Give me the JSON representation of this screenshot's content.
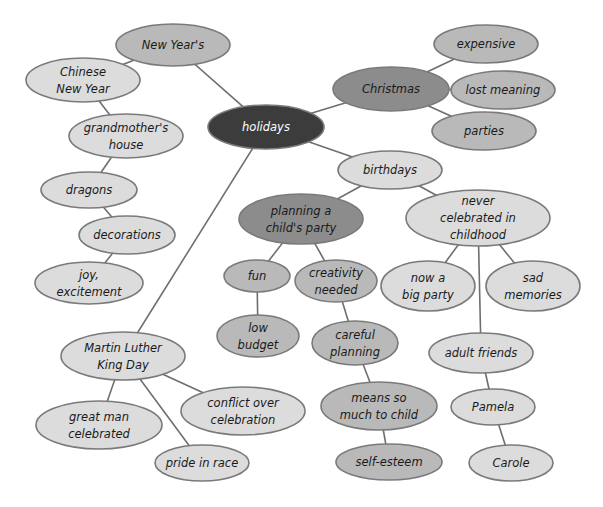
{
  "colors": {
    "root": "#3c3c3c",
    "dark": "#8c8c8c",
    "medium": "#b9b9b9",
    "light": "#dcdcdc",
    "edge": "#6e6e6e"
  },
  "nodes": [
    {
      "id": "holidays",
      "lines": [
        "holidays"
      ],
      "shade": "root"
    },
    {
      "id": "new-years",
      "lines": [
        "New Year's"
      ],
      "shade": "medium"
    },
    {
      "id": "chinese-new-year",
      "lines": [
        "Chinese",
        "New Year"
      ],
      "shade": "light"
    },
    {
      "id": "grandmothers-house",
      "lines": [
        "grandmother's",
        "house"
      ],
      "shade": "light"
    },
    {
      "id": "dragons",
      "lines": [
        "dragons"
      ],
      "shade": "light"
    },
    {
      "id": "decorations",
      "lines": [
        "decorations"
      ],
      "shade": "light"
    },
    {
      "id": "joy-excitement",
      "lines": [
        "joy,",
        "excitement"
      ],
      "shade": "light"
    },
    {
      "id": "christmas",
      "lines": [
        "Christmas"
      ],
      "shade": "dark"
    },
    {
      "id": "expensive",
      "lines": [
        "expensive"
      ],
      "shade": "medium"
    },
    {
      "id": "lost-meaning",
      "lines": [
        "lost meaning"
      ],
      "shade": "medium"
    },
    {
      "id": "parties",
      "lines": [
        "parties"
      ],
      "shade": "medium"
    },
    {
      "id": "birthdays",
      "lines": [
        "birthdays"
      ],
      "shade": "light"
    },
    {
      "id": "planning-childs-party",
      "lines": [
        "planning a",
        "child's party"
      ],
      "shade": "dark"
    },
    {
      "id": "never-celebrated",
      "lines": [
        "never",
        "celebrated in",
        "childhood"
      ],
      "shade": "light"
    },
    {
      "id": "fun",
      "lines": [
        "fun"
      ],
      "shade": "medium"
    },
    {
      "id": "creativity-needed",
      "lines": [
        "creativity",
        "needed"
      ],
      "shade": "medium"
    },
    {
      "id": "low-budget",
      "lines": [
        "low",
        "budget"
      ],
      "shade": "medium"
    },
    {
      "id": "careful-planning",
      "lines": [
        "careful",
        "planning"
      ],
      "shade": "medium"
    },
    {
      "id": "means-so-much",
      "lines": [
        "means so",
        "much to child"
      ],
      "shade": "medium"
    },
    {
      "id": "self-esteem",
      "lines": [
        "self-esteem"
      ],
      "shade": "medium"
    },
    {
      "id": "now-big-party",
      "lines": [
        "now a",
        "big party"
      ],
      "shade": "light"
    },
    {
      "id": "sad-memories",
      "lines": [
        "sad",
        "memories"
      ],
      "shade": "light"
    },
    {
      "id": "adult-friends",
      "lines": [
        "adult friends"
      ],
      "shade": "light"
    },
    {
      "id": "pamela",
      "lines": [
        "Pamela"
      ],
      "shade": "light"
    },
    {
      "id": "carole",
      "lines": [
        "Carole"
      ],
      "shade": "light"
    },
    {
      "id": "mlk-day",
      "lines": [
        "Martin Luther",
        "King Day"
      ],
      "shade": "light"
    },
    {
      "id": "great-man",
      "lines": [
        "great man",
        "celebrated"
      ],
      "shade": "light"
    },
    {
      "id": "pride-in-race",
      "lines": [
        "pride in race"
      ],
      "shade": "light"
    },
    {
      "id": "conflict-over-celebration",
      "lines": [
        "conflict over",
        "celebration"
      ],
      "shade": "light"
    }
  ],
  "edges": [
    [
      "holidays",
      "new-years"
    ],
    [
      "new-years",
      "chinese-new-year"
    ],
    [
      "chinese-new-year",
      "grandmothers-house"
    ],
    [
      "grandmothers-house",
      "dragons"
    ],
    [
      "dragons",
      "decorations"
    ],
    [
      "decorations",
      "joy-excitement"
    ],
    [
      "holidays",
      "christmas"
    ],
    [
      "christmas",
      "expensive"
    ],
    [
      "christmas",
      "lost-meaning"
    ],
    [
      "christmas",
      "parties"
    ],
    [
      "holidays",
      "birthdays"
    ],
    [
      "birthdays",
      "planning-childs-party"
    ],
    [
      "birthdays",
      "never-celebrated"
    ],
    [
      "planning-childs-party",
      "fun"
    ],
    [
      "planning-childs-party",
      "creativity-needed"
    ],
    [
      "fun",
      "low-budget"
    ],
    [
      "creativity-needed",
      "careful-planning"
    ],
    [
      "careful-planning",
      "means-so-much"
    ],
    [
      "means-so-much",
      "self-esteem"
    ],
    [
      "never-celebrated",
      "now-big-party"
    ],
    [
      "never-celebrated",
      "sad-memories"
    ],
    [
      "never-celebrated",
      "adult-friends"
    ],
    [
      "adult-friends",
      "pamela"
    ],
    [
      "pamela",
      "carole"
    ],
    [
      "holidays",
      "mlk-day"
    ],
    [
      "mlk-day",
      "great-man"
    ],
    [
      "mlk-day",
      "pride-in-race"
    ],
    [
      "mlk-day",
      "conflict-over-celebration"
    ]
  ]
}
